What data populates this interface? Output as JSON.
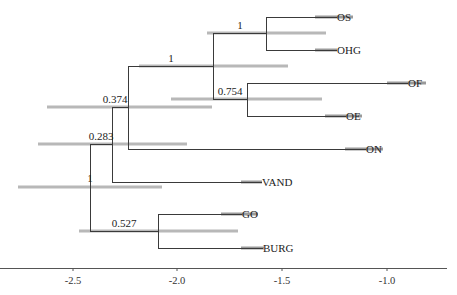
{
  "diagram": {
    "type": "phylogenetic-tree",
    "colors": {
      "branch": "#3a3a3a",
      "hpd_bar": "#b8b8b8",
      "tip_hpd_bar": "#9a9a9a",
      "text": "#222222"
    },
    "axis": {
      "ticks": [
        {
          "value": -2.5,
          "label": "-2.5",
          "x": 73
        },
        {
          "value": -2.0,
          "label": "-2.0",
          "x": 177
        },
        {
          "value": -1.5,
          "label": "-1.5",
          "x": 282
        },
        {
          "value": -1.0,
          "label": "-1.0",
          "x": 387
        }
      ],
      "line": {
        "x1": 0,
        "x2": 447,
        "y": 268
      }
    },
    "taxa": [
      {
        "name": "OS",
        "y": 17,
        "tip_x": 337,
        "hpd": [
          315,
          353
        ]
      },
      {
        "name": "OHG",
        "y": 50,
        "tip_x": 337,
        "hpd": [
          315,
          337
        ]
      },
      {
        "name": "OF",
        "y": 83,
        "tip_x": 408,
        "hpd": [
          387,
          426
        ]
      },
      {
        "name": "OE",
        "y": 116,
        "tip_x": 346,
        "hpd": [
          325,
          362
        ]
      },
      {
        "name": "ON",
        "y": 149,
        "tip_x": 366,
        "hpd": [
          345,
          383
        ]
      },
      {
        "name": "VAND",
        "y": 182,
        "tip_x": 262,
        "hpd": [
          241,
          262
        ]
      },
      {
        "name": "GO",
        "y": 214,
        "tip_x": 242,
        "hpd": [
          221,
          258
        ]
      },
      {
        "name": "BURG",
        "y": 248,
        "tip_x": 263,
        "hpd": [
          241,
          264
        ]
      }
    ],
    "nodes": [
      {
        "id": "root",
        "support": "1",
        "x": 90,
        "y": 187,
        "y_top": 144,
        "y_bot": 231,
        "hpd": [
          18,
          162
        ],
        "label_x": 90,
        "label_y": 182,
        "label_anchor": "middle"
      },
      {
        "id": "n_0283",
        "support": "0.283",
        "x": 112,
        "y": 144,
        "y_top": 107,
        "y_bot": 182,
        "hpd": [
          38,
          187
        ],
        "label_x": 101,
        "label_y": 140,
        "label_anchor": "middle"
      },
      {
        "id": "n_0374",
        "support": "0.374",
        "x": 128,
        "y": 107,
        "y_top": 66,
        "y_bot": 149,
        "hpd": [
          47,
          212
        ],
        "label_x": 115,
        "label_y": 103,
        "label_anchor": "middle"
      },
      {
        "id": "n_1_big",
        "support": "1",
        "x": 213,
        "y": 66,
        "y_top": 33,
        "y_bot": 99,
        "hpd": [
          139,
          288
        ],
        "label_x": 171,
        "label_y": 62,
        "label_anchor": "middle"
      },
      {
        "id": "n_1_oshg",
        "support": "1",
        "x": 266,
        "y": 33,
        "y_top": 17,
        "y_bot": 50,
        "hpd": [
          207,
          326
        ],
        "label_x": 240,
        "label_y": 29,
        "label_anchor": "middle"
      },
      {
        "id": "n_0754",
        "support": "0.754",
        "x": 247,
        "y": 99,
        "y_top": 83,
        "y_bot": 116,
        "hpd": [
          171,
          322
        ],
        "label_x": 230,
        "label_y": 95,
        "label_anchor": "middle"
      },
      {
        "id": "n_0527",
        "support": "0.527",
        "x": 158,
        "y": 231,
        "y_top": 214,
        "y_bot": 248,
        "hpd": [
          79,
          238
        ],
        "label_x": 124,
        "label_y": 227,
        "label_anchor": "middle"
      }
    ],
    "edges": [
      {
        "from": "root",
        "x1": 90,
        "x2": 112,
        "y": 144
      },
      {
        "from": "root",
        "x1": 90,
        "x2": 158,
        "y": 231
      },
      {
        "from": "n_0283",
        "x1": 112,
        "x2": 128,
        "y": 107
      },
      {
        "from": "n_0283",
        "x1": 112,
        "x2": 262,
        "y": 182,
        "to": "VAND"
      },
      {
        "from": "n_0374",
        "x1": 128,
        "x2": 213,
        "y": 66
      },
      {
        "from": "n_0374",
        "x1": 128,
        "x2": 366,
        "y": 149,
        "to": "ON"
      },
      {
        "from": "n_1_big",
        "x1": 213,
        "x2": 266,
        "y": 33
      },
      {
        "from": "n_1_big",
        "x1": 213,
        "x2": 247,
        "y": 99
      },
      {
        "from": "n_1_oshg",
        "x1": 266,
        "x2": 337,
        "y": 17,
        "to": "OS"
      },
      {
        "from": "n_1_oshg",
        "x1": 266,
        "x2": 337,
        "y": 50,
        "to": "OHG"
      },
      {
        "from": "n_0754",
        "x1": 247,
        "x2": 408,
        "y": 83,
        "to": "OF"
      },
      {
        "from": "n_0754",
        "x1": 247,
        "x2": 346,
        "y": 116,
        "to": "OE"
      },
      {
        "from": "n_0527",
        "x1": 158,
        "x2": 242,
        "y": 214,
        "to": "GO"
      },
      {
        "from": "n_0527",
        "x1": 158,
        "x2": 263,
        "y": 248,
        "to": "BURG"
      }
    ]
  }
}
